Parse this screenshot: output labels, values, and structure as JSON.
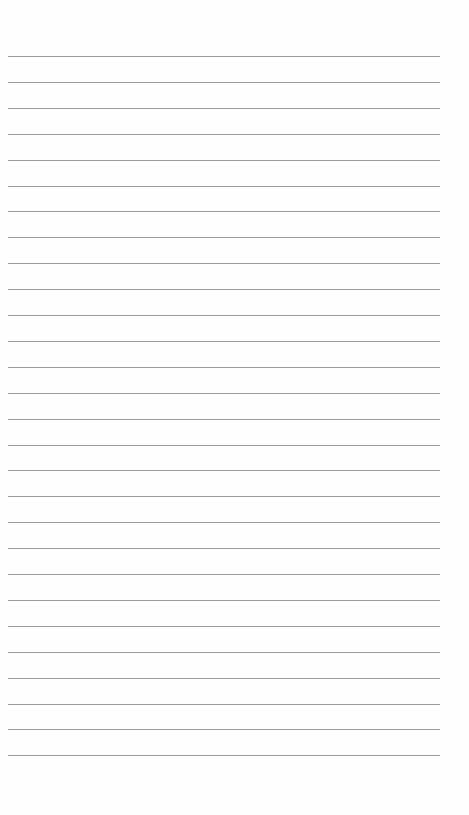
{
  "page": {
    "type": "blank lined paper",
    "background_color": "#fefefe",
    "line_color": "#8a8a8a",
    "line_count": 28,
    "first_line_y": 56,
    "line_spacing": 25.9,
    "line_left": 8,
    "line_width": 432,
    "text": ""
  }
}
